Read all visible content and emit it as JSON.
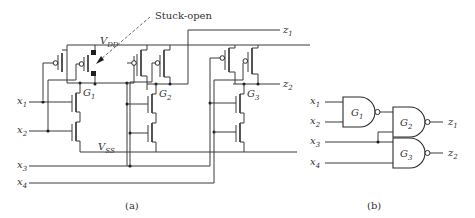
{
  "figure": {
    "annotation": "Stuck-open",
    "panel_a": {
      "caption": "(a)",
      "supply_top": {
        "main": "V",
        "sub": "DD"
      },
      "supply_bottom": {
        "main": "V",
        "sub": "SS"
      },
      "gates": [
        {
          "main": "G",
          "sub": "1"
        },
        {
          "main": "G",
          "sub": "2"
        },
        {
          "main": "G",
          "sub": "3"
        }
      ],
      "inputs": [
        {
          "main": "x",
          "sub": "1"
        },
        {
          "main": "x",
          "sub": "2"
        },
        {
          "main": "x",
          "sub": "3"
        },
        {
          "main": "x",
          "sub": "4"
        }
      ],
      "outputs": [
        {
          "main": "z",
          "sub": "1"
        },
        {
          "main": "z",
          "sub": "2"
        }
      ]
    },
    "panel_b": {
      "caption": "(b)",
      "gates": [
        {
          "main": "G",
          "sub": "1"
        },
        {
          "main": "G",
          "sub": "2"
        },
        {
          "main": "G",
          "sub": "3"
        }
      ],
      "inputs": [
        {
          "main": "x",
          "sub": "1"
        },
        {
          "main": "x",
          "sub": "2"
        },
        {
          "main": "x",
          "sub": "3"
        },
        {
          "main": "x",
          "sub": "4"
        }
      ],
      "outputs": [
        {
          "main": "z",
          "sub": "1"
        },
        {
          "main": "z",
          "sub": "2"
        }
      ]
    }
  }
}
